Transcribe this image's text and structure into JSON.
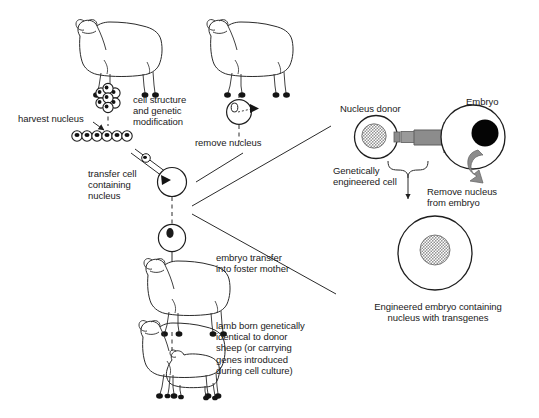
{
  "diagram": {
    "colors": {
      "line": "#2b2b2b",
      "text": "#1a1a1a",
      "arrow_gray": "#8c8c8c",
      "nucleus_black": "#000000",
      "nucleus_hatch": "#b3b3b3",
      "background": "#ffffff",
      "hoof_black": "#111111"
    },
    "left_panel": {
      "labels": [
        {
          "name": "harvest-nucleus",
          "text": "harvest nucleus"
        },
        {
          "name": "cell-structure-and-genetic-modification",
          "text": "cell structure\nand genetic\nmodification"
        },
        {
          "name": "remove-nucleus",
          "text": "remove nucleus"
        },
        {
          "name": "transfer-cell-containing-nucleus",
          "text": "transfer cell\ncontaining\nnucleus"
        },
        {
          "name": "embryo-transfer-into-foster-mother",
          "text": "embryo transfer\ninto foster mother"
        },
        {
          "name": "lamb-born-genetically-identical",
          "text": "lamb born genetically\nidentical to donor\nsheep (or carrying\ngenes introduced\nduring cell culture)"
        }
      ],
      "figures": [
        {
          "name": "donor-sheep",
          "kind": "sheep"
        },
        {
          "name": "egg-donor-sheep",
          "kind": "sheep"
        },
        {
          "name": "cell-cluster",
          "kind": "cell-cluster",
          "cell_count": 7
        },
        {
          "name": "cultured-cell-row",
          "kind": "cell-row",
          "cell_count": 6
        },
        {
          "name": "oocyte-with-nucleus",
          "kind": "oocyte"
        },
        {
          "name": "enucleated-egg",
          "kind": "egg"
        },
        {
          "name": "reconstructed-embryo",
          "kind": "embryo"
        },
        {
          "name": "foster-mother-sheep",
          "kind": "sheep"
        },
        {
          "name": "ewe-with-cloned-lamb",
          "kind": "sheep-with-lamb"
        }
      ]
    },
    "right_panel": {
      "labels": [
        {
          "name": "nucleus-donor",
          "text": "Nucleus donor"
        },
        {
          "name": "embryo",
          "text": "Embryo"
        },
        {
          "name": "genetically-engineered-cell",
          "text": "Genetically\nengineered cell"
        },
        {
          "name": "remove-nucleus-from-embryo",
          "text": "Remove nucleus\nfrom embryo"
        },
        {
          "name": "engineered-embryo-caption",
          "text": "Engineered embryo containing\nnucleus with transgenes"
        }
      ],
      "figures": [
        {
          "name": "nucleus-donor-cell",
          "kind": "cell-hatched-nucleus"
        },
        {
          "name": "micropipette",
          "kind": "pipette"
        },
        {
          "name": "injection-arrow",
          "kind": "gray-arrow-right"
        },
        {
          "name": "recipient-embryo",
          "kind": "cell-black-nucleus"
        },
        {
          "name": "nucleus-removal-arrow",
          "kind": "gray-curved-arrow"
        },
        {
          "name": "engineered-embryo",
          "kind": "cell-hatched-nucleus"
        }
      ]
    }
  }
}
